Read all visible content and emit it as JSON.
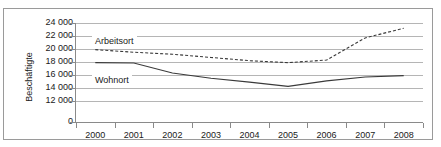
{
  "chart_data": {
    "type": "line",
    "title": "",
    "xlabel": "",
    "ylabel": "Beschäftigte",
    "categories": [
      "2000",
      "2001",
      "2002",
      "2003",
      "2004",
      "2005",
      "2006",
      "2007",
      "2008"
    ],
    "ytick_labels": [
      "24 000",
      "22 000",
      "20 000",
      "18 000",
      "16 000",
      "14 000",
      "12 000",
      "0"
    ],
    "ytick_values": [
      24000,
      22000,
      20000,
      18000,
      16000,
      14000,
      12000,
      0
    ],
    "ylim": [
      11000,
      24000
    ],
    "grid": true,
    "legend_position": "inline-annotation",
    "series": [
      {
        "name": "Arbeitsort",
        "style": "dashed",
        "color": "#3a3a3a",
        "values": [
          19900,
          19500,
          19200,
          18700,
          18200,
          17900,
          18300,
          21700,
          23200
        ]
      },
      {
        "name": "Wohnort",
        "style": "solid",
        "color": "#3a3a3a",
        "values": [
          17900,
          17850,
          16300,
          15500,
          14900,
          14250,
          15100,
          15700,
          15900
        ]
      }
    ],
    "annotations": [
      {
        "text": "Arbeitsort",
        "series": "Arbeitsort"
      },
      {
        "text": "Wohnort",
        "series": "Wohnort"
      }
    ]
  }
}
